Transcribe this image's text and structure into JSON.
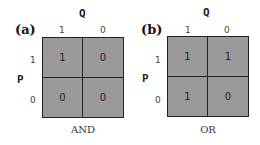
{
  "panels": [
    {
      "label": "(a)",
      "col_var": "Q",
      "row_var": "P",
      "col_ticks": [
        "1",
        "0"
      ],
      "row_ticks": [
        "1",
        "0"
      ],
      "cells": [
        [
          "1",
          "0"
        ],
        [
          "0",
          "0"
        ]
      ],
      "caption": "AND"
    },
    {
      "label": "(b)",
      "col_var": "Q",
      "row_var": "P",
      "col_ticks": [
        "1",
        "0"
      ],
      "row_ticks": [
        "1",
        "0"
      ],
      "cells": [
        [
          "1",
          "1"
        ],
        [
          "1",
          "0"
        ]
      ],
      "caption": "OR"
    }
  ],
  "colors": {
    "cell_fill": "#9a9a9a",
    "grid_line": "#222222"
  }
}
